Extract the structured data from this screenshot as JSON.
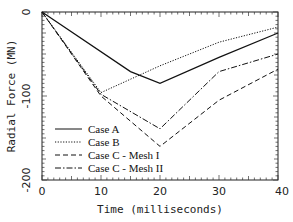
{
  "chart_data": {
    "type": "line",
    "title": "",
    "xlabel": "Time  (milliseconds)",
    "ylabel": "Radial Force (MN)",
    "xlim": [
      0,
      40
    ],
    "ylim": [
      -200,
      0
    ],
    "x_ticks": [
      "0",
      "10",
      "20",
      "30",
      "40"
    ],
    "y_ticks": [
      "0",
      "-100",
      "-200"
    ],
    "grid": false,
    "legend_position": "lower-left",
    "series": [
      {
        "name": "Case A",
        "style": "solid",
        "x": [
          0,
          15,
          20,
          30,
          40
        ],
        "y": [
          0,
          -71,
          -85,
          -54,
          -25
        ]
      },
      {
        "name": "Case B",
        "style": "dotted",
        "x": [
          0,
          10,
          20,
          30,
          40
        ],
        "y": [
          0,
          -96,
          -64,
          -36,
          -18
        ]
      },
      {
        "name": "Case C - Mesh I",
        "style": "dashed",
        "x": [
          0,
          10,
          20,
          30,
          40
        ],
        "y": [
          0,
          -100,
          -160,
          -105,
          -68
        ]
      },
      {
        "name": "Case C - Mesh II",
        "style": "dashdot",
        "x": [
          0,
          10,
          20,
          30,
          40
        ],
        "y": [
          0,
          -98,
          -139,
          -71,
          -50
        ]
      }
    ]
  }
}
